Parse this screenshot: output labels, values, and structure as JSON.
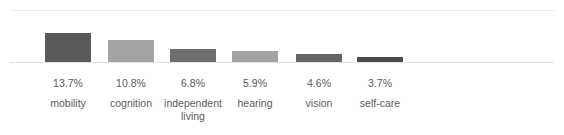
{
  "chart_data": {
    "type": "bar",
    "title": "",
    "subtitle": "",
    "xlabel": "",
    "ylabel": "",
    "categories": [
      "mobility",
      "cognition",
      "independent living",
      "hearing",
      "vision",
      "self-care"
    ],
    "values": [
      13.7,
      10.8,
      6.8,
      5.9,
      4.6,
      3.7
    ],
    "value_labels": [
      "13.7%",
      "10.8%",
      "6.8%",
      "5.9%",
      "4.6%",
      "3.7%"
    ],
    "bar_colors": [
      "#5a5a5a",
      "#a3a3a3",
      "#6e6e6e",
      "#a3a3a3",
      "#656565",
      "#4a4a4a"
    ],
    "ylim": [
      0,
      30
    ],
    "grid": true,
    "gridlines": [
      0,
      30
    ],
    "legend": "none",
    "axis_ticks_shown": false,
    "value_suffix": "%"
  },
  "style": {
    "background": "#ffffff",
    "gridline_color": "#eaeaea",
    "baseline_color": "#e4e4e4",
    "text_color": "#5b5b5b"
  },
  "bars": [
    {
      "label": "mobility",
      "value_label": "13.7%",
      "value": 13.7,
      "color": "#5a5a5a",
      "x": 45,
      "height": 29
    },
    {
      "label": "cognition",
      "value_label": "10.8%",
      "value": 10.8,
      "color": "#a3a3a3",
      "x": 108,
      "height": 22
    },
    {
      "label": "independent living",
      "value_label": "6.8%",
      "value": 6.8,
      "color": "#6e6e6e",
      "x": 170,
      "height": 13
    },
    {
      "label": "hearing",
      "value_label": "5.9%",
      "value": 5.9,
      "color": "#a3a3a3",
      "x": 232,
      "height": 11
    },
    {
      "label": "vision",
      "value_label": "4.6%",
      "value": 4.6,
      "color": "#656565",
      "x": 296,
      "height": 8
    },
    {
      "label": "self-care",
      "value_label": "3.7%",
      "value": 3.7,
      "color": "#4a4a4a",
      "x": 357,
      "height": 5
    }
  ]
}
